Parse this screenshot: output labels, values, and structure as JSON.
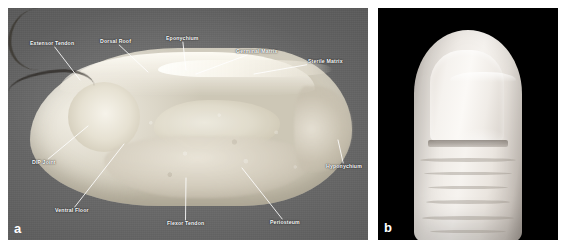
{
  "figure": {
    "panels": [
      {
        "letter": "a",
        "type": "anatomical-cross-section",
        "description": "Sagittal cross-section of a fingertip showing the perionychium and distal phalanx",
        "background_color": "#6e6e6e",
        "labels": [
          {
            "id": "extensor-tendon",
            "text": "Extensor Tendon",
            "label_x": 22,
            "label_y": 33,
            "tip_x": 72,
            "tip_y": 72
          },
          {
            "id": "dorsal-roof",
            "text": "Dorsal Roof",
            "label_x": 92,
            "label_y": 31,
            "tip_x": 140,
            "tip_y": 64
          },
          {
            "id": "eponychium",
            "text": "Eponychium",
            "label_x": 158,
            "label_y": 28,
            "tip_x": 178,
            "tip_y": 62
          },
          {
            "id": "germinal-matrix",
            "text": "Germinal Matrix",
            "label_x": 228,
            "label_y": 41,
            "tip_x": 188,
            "tip_y": 66
          },
          {
            "id": "sterile-matrix",
            "text": "Sterile Matrix",
            "label_x": 300,
            "label_y": 51,
            "tip_x": 246,
            "tip_y": 66
          },
          {
            "id": "dip-joint",
            "text": "DIP Joint",
            "label_x": 24,
            "label_y": 152,
            "tip_x": 80,
            "tip_y": 118
          },
          {
            "id": "ventral-floor",
            "text": "Ventral Floor",
            "label_x": 47,
            "label_y": 200,
            "tip_x": 116,
            "tip_y": 136
          },
          {
            "id": "flexor-tendon",
            "text": "Flexor Tendon",
            "label_x": 159,
            "label_y": 213,
            "tip_x": 178,
            "tip_y": 170
          },
          {
            "id": "periosteum",
            "text": "Periosteum",
            "label_x": 262,
            "label_y": 212,
            "tip_x": 234,
            "tip_y": 160
          },
          {
            "id": "hyponychium",
            "text": "Hyponychium",
            "label_x": 318,
            "label_y": 156,
            "tip_x": 330,
            "tip_y": 132
          }
        ]
      },
      {
        "letter": "b",
        "type": "clinical-photograph",
        "description": "Dorsal view photograph of a normal fingertip and nail on a black background",
        "background_color": "#000000"
      }
    ]
  }
}
